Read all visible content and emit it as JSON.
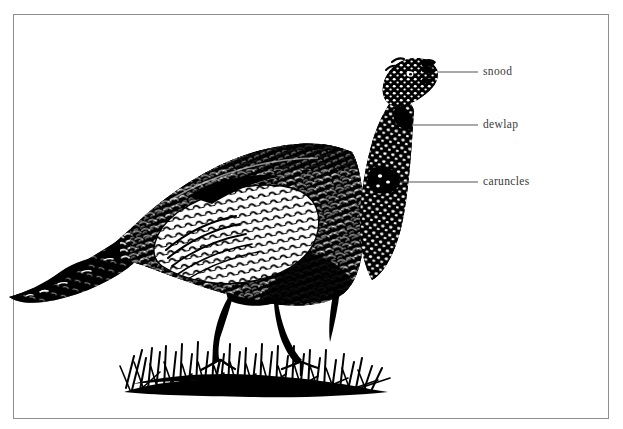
{
  "figure": {
    "style": "black-and-white engraving",
    "background_color": "#ffffff",
    "ink_color": "#000000",
    "frame": {
      "name": "rectangular-border",
      "color": "#8d8d8d",
      "x": 13,
      "y": 14,
      "width": 596,
      "height": 405
    }
  },
  "annotations": [
    {
      "id": "snood",
      "label": "snood",
      "leader_line": {
        "x1": 438,
        "y1": 72,
        "x2": 478,
        "y2": 72
      },
      "label_x": 483,
      "label_y": 66
    },
    {
      "id": "dewlap",
      "label": "dewlap",
      "leader_line": {
        "x1": 412,
        "y1": 125,
        "x2": 478,
        "y2": 125
      },
      "label_x": 483,
      "label_y": 119
    },
    {
      "id": "caruncles",
      "label": "caruncles",
      "leader_line": {
        "x1": 400,
        "y1": 182,
        "x2": 478,
        "y2": 182
      },
      "label_x": 483,
      "label_y": 176
    }
  ],
  "label_style": {
    "color": "#3a3a3a",
    "font_size_px": 11.5,
    "leader_color": "#555555"
  }
}
